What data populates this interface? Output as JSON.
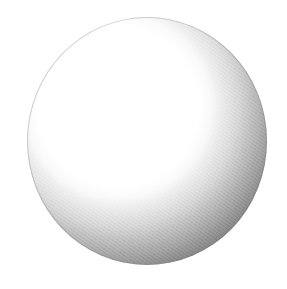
{
  "image": {
    "subject": "pencil sketch of a shaded sphere",
    "background_color": "#ffffff",
    "highlight_color": "#ffffff",
    "shadow_color": "#5e5e5e",
    "light_direction": "upper-left"
  }
}
